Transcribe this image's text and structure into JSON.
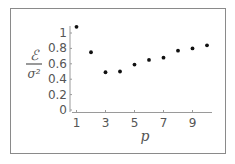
{
  "chart_data": {
    "type": "scatter",
    "title": "",
    "xlabel": "p",
    "ylabel": "ℰ / σ²",
    "ylabel_numerator": "ℰ",
    "ylabel_denominator": "σ²",
    "x": [
      1,
      2,
      3,
      4,
      5,
      6,
      7,
      8,
      9,
      10
    ],
    "values": [
      1.08,
      0.75,
      0.49,
      0.5,
      0.59,
      0.65,
      0.68,
      0.77,
      0.8,
      0.84
    ],
    "xticks": [
      "1",
      "3",
      "5",
      "7",
      "9"
    ],
    "yticks": [
      "0",
      "0.2",
      "0.4",
      "0.6",
      "0.8",
      "1"
    ],
    "xlim": [
      0.9,
      10.4
    ],
    "ylim": [
      0,
      1.1
    ],
    "grid": false,
    "legend": null,
    "marker_color": "#111111",
    "axis_color": "#9a9a9a"
  }
}
